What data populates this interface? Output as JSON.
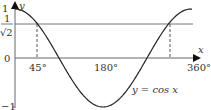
{
  "graph": {
    "function_label": "y = cos x",
    "x_axis_label": "x",
    "y_axis_label": "y",
    "y_ticks": [
      {
        "label": "1",
        "value": 1
      },
      {
        "label": "0",
        "value": 0
      },
      {
        "label": "−1",
        "value": -1
      }
    ],
    "y_special": {
      "numerator": "1",
      "denominator": "√2",
      "value": 0.7071
    },
    "x_ticks": [
      {
        "label": "45°",
        "value": 45
      },
      {
        "label": "180°",
        "value": 180
      },
      {
        "label": "360°",
        "value": 360
      }
    ],
    "dashed_lines_at": [
      45,
      315
    ],
    "colors": {
      "curve": "#222222",
      "axis": "#555555",
      "reference": "#666666"
    }
  }
}
